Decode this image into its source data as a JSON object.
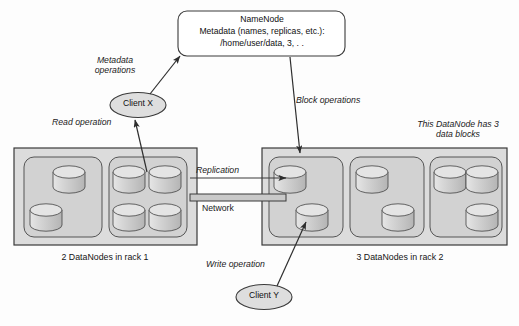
{
  "diagram": {
    "namenode": {
      "name": "namenode",
      "line1": "NameNode",
      "line2": "Metadata (names, replicas, etc.):",
      "line3": "/home/user/data, 3, . ."
    },
    "clients": [
      {
        "id": "client-x",
        "label": "Client X"
      },
      {
        "id": "client-y",
        "label": "Client Y"
      }
    ],
    "annotations": {
      "metadata_operations": "Metadata\noperations",
      "metadata_operations_line1": "Metadata",
      "metadata_operations_line2": "operations",
      "read_operation": "Read operation",
      "block_operations": "Block operations",
      "this_datanode_line1": "This DataNode has 3",
      "this_datanode_line2": "data blocks",
      "replication": "Replication",
      "network": "Network",
      "write_operation": "Write operation"
    },
    "racks": [
      {
        "id": "rack-1",
        "caption": "2 DataNodes in rack 1",
        "datanode_count": 2,
        "datanodes": [
          {
            "id": "rack1-dn1",
            "blocks": 2
          },
          {
            "id": "rack1-dn2",
            "blocks": 4
          }
        ]
      },
      {
        "id": "rack-2",
        "caption": "3 DataNodes in rack 2",
        "datanode_count": 3,
        "datanodes": [
          {
            "id": "rack2-dn1",
            "blocks": 2
          },
          {
            "id": "rack2-dn2",
            "blocks": 2
          },
          {
            "id": "rack2-dn3",
            "blocks": 3
          }
        ]
      }
    ],
    "colors": {
      "background": "#fdfdfd",
      "stroke": "#3a3a3a",
      "rack_fill": "#dcdcdc",
      "datanode_fill": "#d2d2d2",
      "cylinder_fill": "#cfcfcf",
      "cylinder_top": "#e2e2e2",
      "namenode_fill": "#ffffff",
      "network_bar": "#c9c9c9",
      "text": "#141414"
    }
  }
}
